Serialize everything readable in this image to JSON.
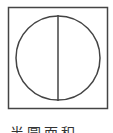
{
  "diagram": {
    "shape": "circle-in-square-with-vertical-diameter",
    "stroke_color": "#444444",
    "square": {
      "x": 8,
      "y": 7,
      "width": 100,
      "height": 102
    },
    "circle": {
      "cx": 58,
      "cy": 58,
      "r": 42
    },
    "diameter": {
      "x": 58,
      "y1": 15,
      "y2": 101
    }
  },
  "caption": {
    "text": "半圆面积"
  }
}
